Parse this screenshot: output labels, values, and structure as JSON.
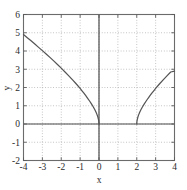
{
  "chart_data": {
    "type": "line",
    "title": "",
    "xlabel": "x",
    "ylabel": "y",
    "xlim": [
      -4,
      4
    ],
    "ylim": [
      -2,
      6
    ],
    "xticks": [
      -4,
      -3,
      -2,
      -1,
      0,
      1,
      2,
      3,
      4
    ],
    "yticks": [
      -2,
      -1,
      0,
      1,
      2,
      3,
      4,
      5,
      6
    ],
    "xtick_labels": [
      "-4",
      "-3",
      "-2",
      "-1",
      "0",
      "1",
      "2",
      "3",
      "4"
    ],
    "ytick_labels": [
      "-2",
      "-1",
      "0",
      "1",
      "2",
      "3",
      "4",
      "5",
      "6"
    ],
    "grid": true,
    "grid_style": "dotted",
    "legend": "none",
    "series": [
      {
        "name": "left-branch",
        "color": "#555555",
        "points": [
          [
            -4.0,
            4.9
          ],
          [
            -3.8,
            4.73
          ],
          [
            -3.6,
            4.56
          ],
          [
            -3.4,
            4.38
          ],
          [
            -3.2,
            4.2
          ],
          [
            -3.0,
            4.02
          ],
          [
            -2.8,
            3.84
          ],
          [
            -2.6,
            3.65
          ],
          [
            -2.4,
            3.46
          ],
          [
            -2.2,
            3.26
          ],
          [
            -2.0,
            3.06
          ],
          [
            -1.8,
            2.85
          ],
          [
            -1.6,
            2.64
          ],
          [
            -1.4,
            2.42
          ],
          [
            -1.2,
            2.19
          ],
          [
            -1.0,
            1.95
          ],
          [
            -0.9,
            1.82
          ],
          [
            -0.8,
            1.69
          ],
          [
            -0.7,
            1.55
          ],
          [
            -0.6,
            1.41
          ],
          [
            -0.5,
            1.26
          ],
          [
            -0.4,
            1.1
          ],
          [
            -0.3,
            0.93
          ],
          [
            -0.22,
            0.78
          ],
          [
            -0.15,
            0.63
          ],
          [
            -0.1,
            0.5
          ],
          [
            -0.06,
            0.38
          ],
          [
            -0.03,
            0.26
          ],
          [
            -0.012,
            0.16
          ],
          [
            -0.004,
            0.09
          ],
          [
            0.0,
            0.0
          ]
        ]
      },
      {
        "name": "right-branch",
        "color": "#555555",
        "points": [
          [
            2.0,
            0.0
          ],
          [
            2.004,
            0.09
          ],
          [
            2.012,
            0.16
          ],
          [
            2.03,
            0.26
          ],
          [
            2.06,
            0.38
          ],
          [
            2.1,
            0.5
          ],
          [
            2.15,
            0.63
          ],
          [
            2.22,
            0.78
          ],
          [
            2.3,
            0.93
          ],
          [
            2.4,
            1.1
          ],
          [
            2.5,
            1.26
          ],
          [
            2.6,
            1.41
          ],
          [
            2.7,
            1.55
          ],
          [
            2.8,
            1.69
          ],
          [
            2.9,
            1.82
          ],
          [
            3.0,
            1.95
          ],
          [
            3.2,
            2.19
          ],
          [
            3.4,
            2.42
          ],
          [
            3.6,
            2.64
          ],
          [
            3.8,
            2.85
          ],
          [
            4.0,
            2.9
          ]
        ]
      }
    ]
  }
}
